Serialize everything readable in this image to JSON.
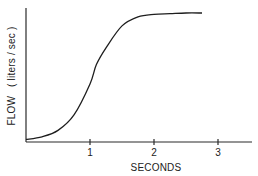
{
  "chart_data": {
    "type": "line",
    "title": "",
    "xlabel": "SECONDS",
    "ylabel": "FLOW   ( liters / sec )",
    "xlim": [
      0,
      3.5
    ],
    "ylim": [
      0,
      1.05
    ],
    "xticks": [
      1,
      2,
      3
    ],
    "xtick_labels": [
      "1",
      "2",
      "3"
    ],
    "yticks": [],
    "grid": false,
    "legend": "none",
    "series": [
      {
        "name": "flow",
        "x": [
          0,
          0.25,
          0.5,
          0.75,
          1.0,
          1.1,
          1.25,
          1.5,
          1.75,
          2.0,
          2.25,
          2.5,
          2.75
        ],
        "y": [
          0.02,
          0.04,
          0.09,
          0.21,
          0.45,
          0.6,
          0.73,
          0.9,
          0.97,
          0.99,
          0.995,
          1.0,
          1.0
        ]
      }
    ]
  }
}
